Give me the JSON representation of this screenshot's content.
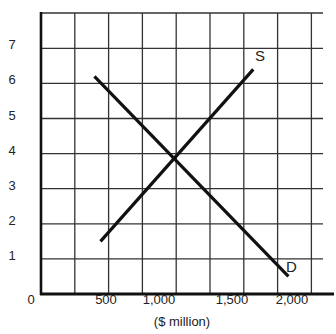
{
  "chart_data": {
    "type": "line",
    "title": "",
    "xlabel": "($ million)",
    "ylabel": "",
    "x_ticks": [
      {
        "label": "0",
        "value": 0
      },
      {
        "label": "500",
        "value": 500
      },
      {
        "label": "1,000",
        "value": 1000
      },
      {
        "label": "1,500",
        "value": 1500
      },
      {
        "label": "2,000",
        "value": 2000
      }
    ],
    "y_ticks": [
      {
        "label": "1",
        "value": 1
      },
      {
        "label": "2",
        "value": 2
      },
      {
        "label": "3",
        "value": 3
      },
      {
        "label": "4",
        "value": 4
      },
      {
        "label": "5",
        "value": 5
      },
      {
        "label": "6",
        "value": 6
      },
      {
        "label": "7",
        "value": 7
      }
    ],
    "xlim": [
      0,
      2100
    ],
    "ylim": [
      0,
      8
    ],
    "grid": true,
    "legend": "none (inline curve labels)",
    "series": [
      {
        "name": "S",
        "label": "S",
        "points": [
          {
            "x": 440,
            "y": 1.5
          },
          {
            "x": 1570,
            "y": 6.4
          }
        ]
      },
      {
        "name": "D",
        "label": "D",
        "points": [
          {
            "x": 395,
            "y": 6.2
          },
          {
            "x": 1830,
            "y": 0.5
          }
        ]
      }
    ],
    "annotations": [
      {
        "text": "S",
        "x": 1650,
        "y": 6.7
      },
      {
        "text": "D",
        "x": 1880,
        "y": 0.8
      }
    ],
    "equilibrium": {
      "x": 1000,
      "y": 4
    }
  },
  "labels": {
    "x_axis_title": "($ million)",
    "origin": "0",
    "supply": "S",
    "demand": "D"
  }
}
